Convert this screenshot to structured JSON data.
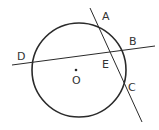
{
  "diagram": {
    "type": "geometry",
    "colors": {
      "stroke": "#2a2a2a",
      "label": "#333333",
      "background": "#ffffff"
    },
    "circle": {
      "center_label": "O",
      "cx": 79,
      "cy": 70,
      "r": 47
    },
    "lines": [
      {
        "name": "line-AC",
        "x1": 90,
        "y1": 8,
        "x2": 142,
        "y2": 122
      },
      {
        "name": "line-DB",
        "x1": 12,
        "y1": 65,
        "x2": 155,
        "y2": 46
      }
    ],
    "points": {
      "A": {
        "label": "A",
        "x": 102,
        "y": 20
      },
      "B": {
        "label": "B",
        "x": 129,
        "y": 45
      },
      "C": {
        "label": "C",
        "x": 128,
        "y": 91
      },
      "D": {
        "label": "D",
        "x": 17,
        "y": 60
      },
      "E": {
        "label": "E",
        "x": 103,
        "y": 68
      },
      "O": {
        "label": "O",
        "x": 74,
        "y": 83
      }
    }
  }
}
